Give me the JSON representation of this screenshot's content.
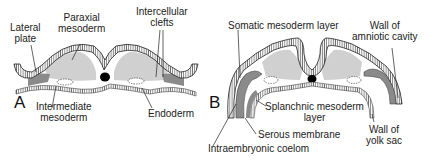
{
  "panel_a": {
    "letter": "A",
    "labels": {
      "lateral_plate": [
        "Lateral",
        "plate"
      ],
      "paraxial_mesoderm": [
        "Paraxial",
        "mesoderm"
      ],
      "intercellular_clefts": [
        "Intercellular",
        "clefts"
      ],
      "intermediate_mesoderm": [
        "Intermediate",
        "mesoderm"
      ],
      "endoderm": "Endoderm"
    }
  },
  "panel_b": {
    "letter": "B",
    "labels": {
      "somatic_mesoderm_layer": "Somatic mesoderm layer",
      "wall_of_amniotic_cavity": [
        "Wall of",
        "amniotic cavity"
      ],
      "splanchnic_mesoderm_layer": [
        "Splanchnic mesoderm",
        "layer"
      ],
      "serous_membrane": "Serous membrane",
      "wall_of_yolk_sac": [
        "Wall of",
        "yolk sac"
      ],
      "intraembryonic_coelom": "Intraembryonic coelom"
    }
  },
  "colors": {
    "line": "#222222",
    "mesoderm_fill": "#cfcfcf",
    "lateral_fill": "#8a8a8a",
    "notochord": "#000000"
  }
}
